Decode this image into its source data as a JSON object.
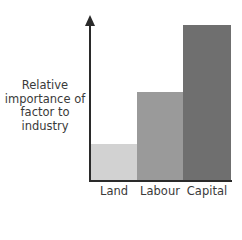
{
  "chart_data": {
    "type": "bar",
    "title": "",
    "xlabel": "",
    "ylabel": "Relative importance of factor to industry",
    "categories": [
      "Land",
      "Labour",
      "Capital"
    ],
    "values": [
      23,
      57,
      100
    ],
    "ylim": [
      0,
      100
    ],
    "grid": false,
    "legend": null,
    "colors": [
      "#d2d2d2",
      "#9a9a9a",
      "#6f6f6f"
    ]
  },
  "ylabel_lines": [
    "Relative",
    "importance of",
    "factor to",
    "industry"
  ]
}
